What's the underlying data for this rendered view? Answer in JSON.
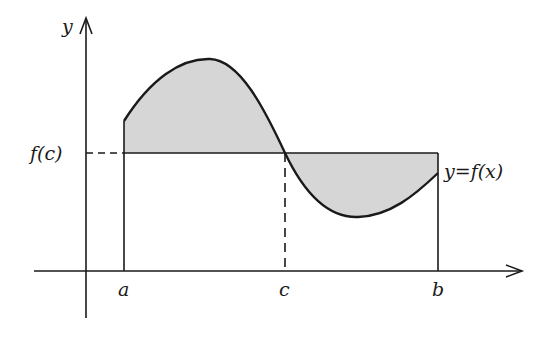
{
  "diagram": {
    "labels": {
      "y_axis": "y",
      "fc": "f(c)",
      "curve": "y=f(x)",
      "a": "a",
      "c": "c",
      "b": "b"
    },
    "colors": {
      "stroke": "#1a1a1a",
      "fill": "#d6d6d6",
      "background": "#ffffff"
    }
  }
}
